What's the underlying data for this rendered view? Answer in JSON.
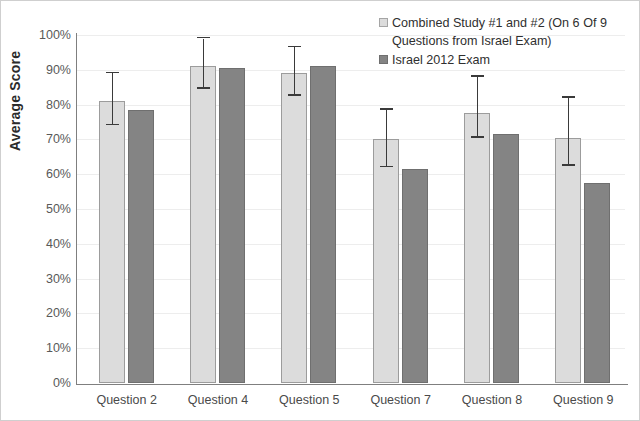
{
  "chart_data": {
    "type": "bar",
    "title": "",
    "xlabel": "",
    "ylabel": "Average Score",
    "ylim": [
      0,
      100
    ],
    "ytick_labels": [
      "100%",
      "90%",
      "80%",
      "70%",
      "60%",
      "50%",
      "40%",
      "30%",
      "20%",
      "10%",
      "0%"
    ],
    "ytick_values": [
      100,
      90,
      80,
      70,
      60,
      50,
      40,
      30,
      20,
      10,
      0
    ],
    "grid": true,
    "legend_position": "top-right",
    "categories": [
      "Question 2",
      "Question 4",
      "Question 5",
      "Question 7",
      "Question 8",
      "Question 9"
    ],
    "series": [
      {
        "name": "Combined Study #1 and #2 (On 6 Of 9 Questions from Israel Exam)",
        "color": "#dcdcdc",
        "values": [
          81,
          91,
          89,
          70,
          77.5,
          70.5
        ],
        "error_low": [
          74,
          84.5,
          82.5,
          62,
          70.5,
          62.5
        ],
        "error_high": [
          89,
          99,
          96.5,
          78.5,
          88,
          82
        ]
      },
      {
        "name": "Israel 2012 Exam",
        "color": "#848484",
        "values": [
          78.5,
          90.5,
          91,
          61.5,
          71.5,
          57.5
        ],
        "error_low": [
          null,
          null,
          null,
          null,
          null,
          null
        ],
        "error_high": [
          null,
          null,
          null,
          null,
          null,
          null
        ]
      }
    ]
  },
  "legend": {
    "items": [
      {
        "label": "Combined Study #1 and #2 (On 6 Of 9 Questions from Israel Exam)",
        "swatch": "light"
      },
      {
        "label": "Israel 2012 Exam",
        "swatch": "dark"
      }
    ]
  },
  "axis": {
    "y_title": "Average Score"
  }
}
